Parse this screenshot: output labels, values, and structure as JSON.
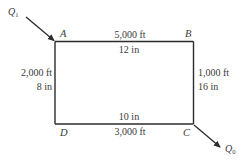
{
  "diagram": {
    "type": "pipe-network-loop",
    "nodes": {
      "A": {
        "label": "A"
      },
      "B": {
        "label": "B"
      },
      "C": {
        "label": "C"
      },
      "D": {
        "label": "D"
      }
    },
    "flows": {
      "inflow": {
        "symbol": "Q",
        "subscript": "1",
        "at": "A"
      },
      "outflow": {
        "symbol": "Q",
        "subscript": "0",
        "at": "C"
      }
    },
    "pipes": {
      "AB": {
        "length": "5,000 ft",
        "diameter": "12 in"
      },
      "BC": {
        "length": "1,000 ft",
        "diameter": "16 in"
      },
      "DC": {
        "length": "3,000 ft",
        "diameter": "10 in"
      },
      "AD": {
        "length": "2,000 ft",
        "diameter": "8 in"
      }
    },
    "colors": {
      "line": "#2b2b2b",
      "text": "#3a3a3a"
    }
  }
}
